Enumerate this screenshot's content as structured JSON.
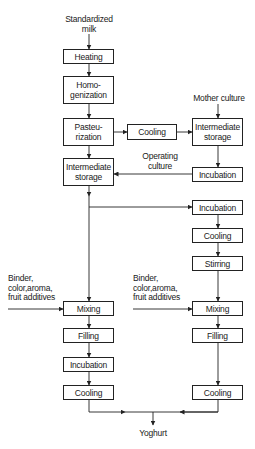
{
  "diagram": {
    "type": "process-flowchart",
    "inputs": {
      "milk": "Standardized\nmilk",
      "mother_culture": "Mother culture",
      "operating_culture": "Operating\nculture",
      "additives_left": "Binder,\ncolor,aroma,\nfruit additives",
      "additives_right": "Binder,\ncolor,aroma,\nfruit additives"
    },
    "output": "Yoghurt",
    "main_chain": {
      "heating": "Heating",
      "homogenization": "Homo-\ngenization",
      "pasteurization": "Pasteu-\nrization",
      "intermediate_storage": "Intermediate\nstorage"
    },
    "culture_chain": {
      "cooling": "Cooling",
      "intermediate_storage": "Intermediate\nstorage",
      "incubation": "Incubation"
    },
    "set_yoghurt_branch": {
      "mixing": "Mixing",
      "filling": "Filling",
      "incubation": "Incubation",
      "cooling": "Cooling"
    },
    "stirred_yoghurt_branch": {
      "incubation": "Incubation",
      "cooling": "Cooling",
      "stirring": "Stirring",
      "mixing": "Mixing",
      "filling": "Filling",
      "cooling_final": "Cooling"
    },
    "edges": [
      [
        "milk",
        "heating"
      ],
      [
        "heating",
        "homogenization"
      ],
      [
        "homogenization",
        "pasteurization"
      ],
      [
        "pasteurization",
        "culture_chain.cooling"
      ],
      [
        "culture_chain.cooling",
        "culture_chain.intermediate_storage"
      ],
      [
        "mother_culture",
        "culture_chain.intermediate_storage"
      ],
      [
        "culture_chain.intermediate_storage",
        "culture_chain.incubation"
      ],
      [
        "culture_chain.incubation",
        "main_chain.intermediate_storage"
      ],
      [
        "pasteurization",
        "main_chain.intermediate_storage"
      ],
      [
        "main_chain.intermediate_storage",
        "set_yoghurt_branch.mixing"
      ],
      [
        "main_chain.intermediate_storage",
        "stirred_yoghurt_branch.incubation"
      ],
      [
        "stirred_yoghurt_branch.incubation",
        "stirred_yoghurt_branch.cooling"
      ],
      [
        "stirred_yoghurt_branch.cooling",
        "stirred_yoghurt_branch.stirring"
      ],
      [
        "stirred_yoghurt_branch.stirring",
        "stirred_yoghurt_branch.mixing"
      ],
      [
        "additives_left",
        "set_yoghurt_branch.mixing"
      ],
      [
        "additives_right",
        "stirred_yoghurt_branch.mixing"
      ],
      [
        "set_yoghurt_branch.mixing",
        "set_yoghurt_branch.filling"
      ],
      [
        "set_yoghurt_branch.filling",
        "set_yoghurt_branch.incubation"
      ],
      [
        "set_yoghurt_branch.incubation",
        "set_yoghurt_branch.cooling"
      ],
      [
        "stirred_yoghurt_branch.mixing",
        "stirred_yoghurt_branch.filling"
      ],
      [
        "stirred_yoghurt_branch.filling",
        "stirred_yoghurt_branch.cooling_final"
      ],
      [
        "set_yoghurt_branch.cooling",
        "output"
      ],
      [
        "stirred_yoghurt_branch.cooling_final",
        "output"
      ]
    ]
  }
}
